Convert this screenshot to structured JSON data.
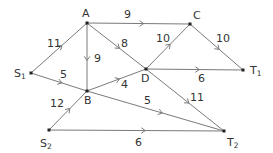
{
  "diagram": {
    "type": "directed-network",
    "line_color": "#7a7a7a",
    "node_color": "#222222",
    "text_color": "#333333",
    "nodes": [
      {
        "id": "S1",
        "label": "S",
        "sub": "1",
        "x": 31,
        "y": 73,
        "lx": 14,
        "ly": 77
      },
      {
        "id": "S2",
        "label": "S",
        "sub": "2",
        "x": 49,
        "y": 130,
        "lx": 40,
        "ly": 147
      },
      {
        "id": "A",
        "label": "A",
        "sub": "",
        "x": 87,
        "y": 23,
        "lx": 82,
        "ly": 17
      },
      {
        "id": "B",
        "label": "B",
        "sub": "",
        "x": 87,
        "y": 91,
        "lx": 84,
        "ly": 104
      },
      {
        "id": "C",
        "label": "C",
        "sub": "",
        "x": 190,
        "y": 24,
        "lx": 193,
        "ly": 19
      },
      {
        "id": "D",
        "label": "D",
        "sub": "",
        "x": 146,
        "y": 69,
        "lx": 141,
        "ly": 82
      },
      {
        "id": "T1",
        "label": "T",
        "sub": "1",
        "x": 243,
        "y": 70,
        "lx": 250,
        "ly": 74
      },
      {
        "id": "T2",
        "label": "T",
        "sub": "2",
        "x": 224,
        "y": 131,
        "lx": 227,
        "ly": 146
      }
    ],
    "edges": [
      {
        "from": "S1",
        "to": "A",
        "weight": "11",
        "wx": 47,
        "wy": 47
      },
      {
        "from": "S1",
        "to": "B",
        "weight": "5",
        "wx": 60,
        "wy": 78
      },
      {
        "from": "S2",
        "to": "B",
        "weight": "12",
        "wx": 50,
        "wy": 107
      },
      {
        "from": "A",
        "to": "C",
        "weight": "9",
        "wx": 124,
        "wy": 18
      },
      {
        "from": "A",
        "to": "B",
        "weight": "9",
        "wx": 94,
        "wy": 62
      },
      {
        "from": "A",
        "to": "D",
        "weight": "8",
        "wx": 121,
        "wy": 47
      },
      {
        "from": "B",
        "to": "D",
        "weight": "4",
        "wx": 121,
        "wy": 88
      },
      {
        "from": "B",
        "to": "T2",
        "weight": "5",
        "wx": 144,
        "wy": 104
      },
      {
        "from": "D",
        "to": "C",
        "weight": "10",
        "wx": 156,
        "wy": 42
      },
      {
        "from": "D",
        "to": "T1",
        "weight": "6",
        "wx": 198,
        "wy": 82
      },
      {
        "from": "D",
        "to": "T2",
        "weight": "11",
        "wx": 190,
        "wy": 101
      },
      {
        "from": "C",
        "to": "T1",
        "weight": "10",
        "wx": 216,
        "wy": 42
      },
      {
        "from": "S2",
        "to": "T2",
        "weight": "6",
        "wx": 135,
        "wy": 146
      }
    ]
  }
}
